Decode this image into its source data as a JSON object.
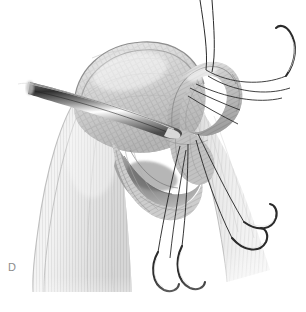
{
  "figure": {
    "panel_label": "D",
    "modality": "medical-illustration",
    "style": "grayscale pen-and-wash anatomical drawing",
    "background_color": "#ffffff",
    "ink_color": "#3a3a3a",
    "tissue_light": "#f2f2f2",
    "tissue_mid": "#c9c9c9",
    "tissue_dark": "#8f8f8f",
    "metal_light": "#fbfbfb",
    "metal_mid": "#9a9a9a",
    "metal_dark": "#454545",
    "suture_color": "#2b2b2b"
  },
  "anatomy": [
    {
      "id": "humeral-head",
      "label": "Humeral head with overlying cuff",
      "shading": "cross-hatched fibrous dome, upper left of center"
    },
    {
      "id": "deltoid-muscle",
      "label": "Deltoid muscle belly",
      "shading": "vertical striations, left lower field"
    },
    {
      "id": "tendon-loop",
      "label": "Mobilized tendon edge / loop",
      "shading": "tubular band curving over the top right"
    },
    {
      "id": "glenoid-recess",
      "label": "Joint recess beneath retracted tendon",
      "shading": "dark concave pocket at center"
    },
    {
      "id": "lateral-muscle",
      "label": "Lateral muscle fibers",
      "shading": "vertical striations, right lower field"
    }
  ],
  "instruments": [
    {
      "id": "elevator",
      "label": "Tapered elevator retractor",
      "orientation": "entering from left, tip at center"
    }
  ],
  "sutures": {
    "thread_count": 6,
    "needle_count": 5,
    "needles": [
      {
        "id": "needle-upper-right",
        "position": "upper right margin"
      },
      {
        "id": "needle-right-upper",
        "position": "right mid field"
      },
      {
        "id": "needle-right-lower",
        "position": "right lower field"
      },
      {
        "id": "needle-bottom-left",
        "position": "bottom center left"
      },
      {
        "id": "needle-bottom-right",
        "position": "bottom center right"
      }
    ],
    "free_ends": [
      {
        "id": "thread-top-a",
        "position": "exits top edge"
      },
      {
        "id": "thread-top-b",
        "position": "exits top edge"
      }
    ]
  }
}
